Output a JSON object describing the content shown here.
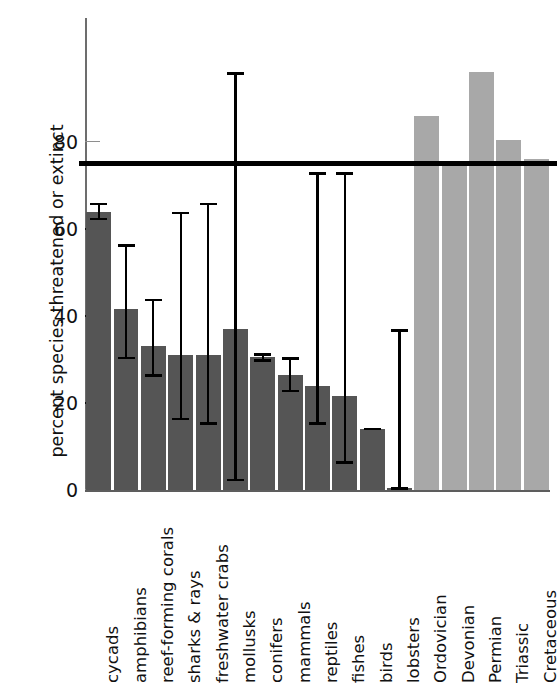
{
  "chart_data": {
    "type": "bar",
    "title": "",
    "xlabel": "",
    "ylabel": "percent species threatened or extinct",
    "ylim": [
      0,
      100
    ],
    "yticks": [
      0,
      20,
      40,
      60,
      80
    ],
    "ytick_labels": [
      "0",
      "20",
      "40",
      "60",
      "80"
    ],
    "grid": false,
    "legend": "none",
    "annotations": [
      {
        "name": "mass-extinction-threshold",
        "type": "hline",
        "value": 75
      }
    ],
    "categories": [
      "cycads",
      "amphibians",
      "reef-forming corals",
      "sharks & rays",
      "freshwater crabs",
      "mollusks",
      "conifers",
      "mammals",
      "reptiles",
      "fishes",
      "birds",
      "lobsters",
      "Ordovician",
      "Devonian",
      "Permian",
      "Triassic",
      "Cretaceous"
    ],
    "values": [
      64,
      41.5,
      33,
      31,
      31,
      37,
      30.5,
      26.5,
      24,
      21.5,
      14,
      0.5,
      86,
      75,
      96,
      80.5,
      76
    ],
    "groups": [
      "modern",
      "modern",
      "modern",
      "modern",
      "modern",
      "modern",
      "modern",
      "modern",
      "modern",
      "modern",
      "modern",
      "modern",
      "past",
      "past",
      "past",
      "past",
      "past"
    ],
    "error_low": [
      62,
      30,
      26,
      16,
      15,
      2,
      29.5,
      22.5,
      15,
      6,
      13.7,
      0,
      null,
      null,
      null,
      null,
      null
    ],
    "error_high": [
      66,
      56.5,
      44,
      64,
      66,
      96,
      31.5,
      30.5,
      73,
      73,
      14.3,
      37,
      null,
      null,
      null,
      null,
      null
    ],
    "series_colors": {
      "modern": "#555555",
      "past": "#a8a8a8"
    },
    "threshold_color": "#000000"
  }
}
